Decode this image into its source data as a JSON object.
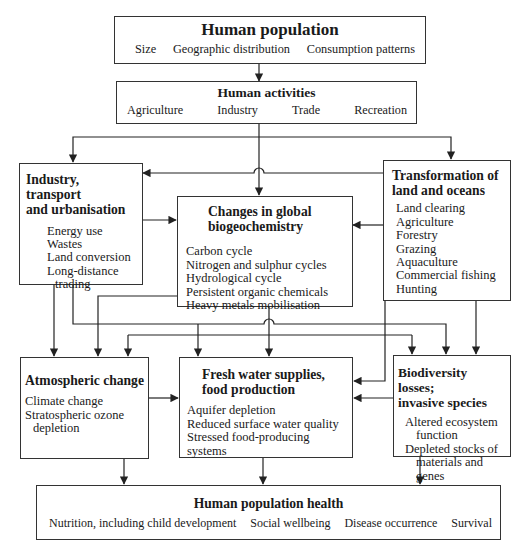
{
  "diagram": {
    "line_color": "#222222",
    "nodes": {
      "population": {
        "title": "Human population",
        "items": [
          "Size",
          "Geographic distribution",
          "Consumption patterns"
        ]
      },
      "activities": {
        "title": "Human activities",
        "items": [
          "Agriculture",
          "Industry",
          "Trade",
          "Recreation"
        ]
      },
      "industry": {
        "title_line1": "Industry, transport",
        "title_line2": "and urbanisation",
        "items": [
          "Energy use",
          "Wastes",
          "Land conversion",
          "Long-distance",
          "trading"
        ]
      },
      "biogeochemistry": {
        "title_line1": "Changes in global",
        "title_line2": "biogeochemistry",
        "items": [
          "Carbon cycle",
          "Nitrogen and sulphur cycles",
          "Hydrological cycle",
          "Persistent organic chemicals",
          "Heavy metals mobilisation"
        ]
      },
      "land": {
        "title_line1": "Transformation of",
        "title_line2": "land and oceans",
        "items": [
          "Land clearing",
          "Agriculture",
          "Forestry",
          "Grazing",
          "Aquaculture",
          "Commercial fishing",
          "Hunting"
        ]
      },
      "atmosphere": {
        "title": "Atmospheric change",
        "items": [
          "Climate change",
          "Stratospheric ozone",
          "depletion"
        ]
      },
      "food": {
        "title_line1": "Fresh water supplies,",
        "title_line2": "food production",
        "items": [
          "Aquifer depletion",
          "Reduced surface water quality",
          "Stressed food-producing  systems"
        ]
      },
      "biodiversity": {
        "title_line1": "Biodiversity losses;",
        "title_line2": "invasive species",
        "items": [
          "Altered ecosystem",
          "function",
          "Depleted stocks of",
          "materials and genes"
        ]
      },
      "health": {
        "title": "Human population health",
        "items": [
          "Nutrition, including child development",
          "Social wellbeing",
          "Disease occurrence",
          "Survival"
        ]
      }
    },
    "edges": [
      {
        "from": "population",
        "to": "activities"
      },
      {
        "from": "activities",
        "to": "industry"
      },
      {
        "from": "activities",
        "to": "land"
      },
      {
        "from": "activities",
        "to": "biogeochemistry"
      },
      {
        "from": "land",
        "to": "industry"
      },
      {
        "from": "industry",
        "to": "biogeochemistry"
      },
      {
        "from": "land",
        "to": "biogeochemistry"
      },
      {
        "from": "industry",
        "to": "atmosphere"
      },
      {
        "from": "industry",
        "to": "food"
      },
      {
        "from": "industry",
        "to": "biodiversity"
      },
      {
        "from": "biogeochemistry",
        "to": "atmosphere"
      },
      {
        "from": "biogeochemistry",
        "to": "food"
      },
      {
        "from": "biogeochemistry",
        "to": "biodiversity"
      },
      {
        "from": "land",
        "to": "food"
      },
      {
        "from": "land",
        "to": "biodiversity"
      },
      {
        "from": "atmosphere",
        "to": "food"
      },
      {
        "from": "biodiversity",
        "to": "food"
      },
      {
        "from": "atmosphere",
        "to": "health"
      },
      {
        "from": "food",
        "to": "health"
      },
      {
        "from": "biodiversity",
        "to": "health"
      }
    ]
  }
}
